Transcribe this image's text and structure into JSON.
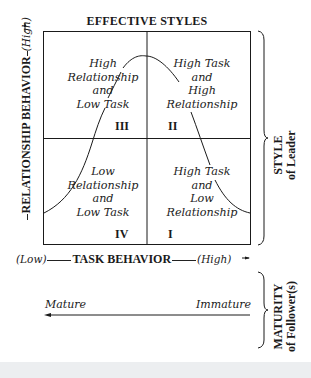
{
  "title": "EFFECTIVE STYLES",
  "quadrants": [
    {
      "id": "III",
      "numeral": "III",
      "text": "High\nRelationship\nand\nLow Task"
    },
    {
      "id": "II",
      "numeral": "II",
      "text": "High Task\nand\nHigh\nRelationship"
    },
    {
      "id": "IV",
      "numeral": "IV",
      "text": "Low\nRelationship\nand\nLow Task"
    },
    {
      "id": "I",
      "numeral": "I",
      "text": "High Task\nand\nLow\nRelationship"
    }
  ],
  "x_axis": {
    "low": "(Low)",
    "label": "TASK BEHAVIOR",
    "high": "(High)"
  },
  "y_axis": {
    "low": "(Low)",
    "label": "RELATIONSHIP BEHAVIOR",
    "high": "(High)"
  },
  "style_bracket": {
    "line1": "STYLE",
    "line2": "of Leader"
  },
  "maturity_bracket": {
    "line1": "MATURITY",
    "line2": "of Follower(s)"
  },
  "maturity_scale": {
    "left": "Mature",
    "right": "Immature"
  },
  "colors": {
    "ink": "#1a1a1a",
    "background": "#ffffff",
    "footer": "#eceef0"
  }
}
